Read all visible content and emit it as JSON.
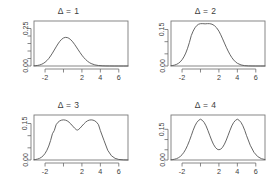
{
  "figure": {
    "layout": "2x2 panel grid",
    "background_color": "#ffffff",
    "line_color": "#555555",
    "axis_color": "#6a6a6a",
    "text_color": "#3d3d3d"
  },
  "chart_data": [
    {
      "type": "line",
      "title": "Δ = 1",
      "xlabel": "",
      "ylabel": "",
      "xlim": [
        -3.2,
        7.0
      ],
      "ylim": [
        0,
        0.3
      ],
      "grid": false,
      "legend": "none",
      "x_ticks": [
        -2,
        0,
        2,
        4,
        6
      ],
      "x_tick_labels": [
        "-2",
        "",
        "2",
        "4",
        "6"
      ],
      "y_ticks": [
        0.0,
        0.05,
        0.1,
        0.15,
        0.2,
        0.25
      ],
      "y_tick_labels": [
        "0.00",
        "",
        "",
        "",
        "",
        "0.25"
      ],
      "delta": 1,
      "description": "Unimodal mixture density, single peak near x = 0.5",
      "x": [
        -3.2,
        -3.0,
        -2.8,
        -2.6,
        -2.4,
        -2.2,
        -2.0,
        -1.8,
        -1.6,
        -1.4,
        -1.2,
        -1.0,
        -0.8,
        -0.6,
        -0.4,
        -0.2,
        0.0,
        0.2,
        0.4,
        0.5,
        0.6,
        0.8,
        1.0,
        1.2,
        1.4,
        1.6,
        1.8,
        2.0,
        2.2,
        2.4,
        2.6,
        2.8,
        3.0,
        3.4,
        3.8,
        4.2,
        4.6,
        5.0,
        5.5,
        6.0,
        6.5,
        7.0
      ],
      "values": [
        0.0012,
        0.0022,
        0.0039,
        0.0066,
        0.0107,
        0.0167,
        0.025,
        0.036,
        0.05,
        0.0668,
        0.0859,
        0.1065,
        0.1273,
        0.1471,
        0.1644,
        0.1779,
        0.1868,
        0.1907,
        0.1896,
        0.1874,
        0.184,
        0.1744,
        0.1609,
        0.1445,
        0.1263,
        0.1076,
        0.0892,
        0.072,
        0.0566,
        0.0433,
        0.0322,
        0.0233,
        0.0164,
        0.0075,
        0.0032,
        0.0012,
        0.0004,
        0.0001,
        0.0,
        0.0,
        0.0,
        0.0
      ]
    },
    {
      "type": "line",
      "title": "Δ = 2",
      "xlabel": "",
      "ylabel": "",
      "xlim": [
        -3.2,
        7.0
      ],
      "ylim": [
        0,
        0.185
      ],
      "grid": false,
      "legend": "none",
      "x_ticks": [
        -2,
        0,
        2,
        4,
        6
      ],
      "x_tick_labels": [
        "-2",
        "",
        "2",
        "4",
        "6"
      ],
      "y_ticks": [
        0.0,
        0.05,
        0.1,
        0.15
      ],
      "y_tick_labels": [
        "0.00",
        "",
        "",
        "0.15"
      ],
      "delta": 2,
      "description": "Broad flat-topped mixture density at the unimodal/bimodal threshold",
      "x": [
        -3.2,
        -3.0,
        -2.8,
        -2.6,
        -2.4,
        -2.2,
        -2.0,
        -1.8,
        -1.6,
        -1.4,
        -1.2,
        -1.0,
        -0.8,
        -0.6,
        -0.4,
        -0.2,
        0.0,
        0.25,
        0.5,
        0.75,
        1.0,
        1.25,
        1.5,
        1.75,
        2.0,
        2.2,
        2.4,
        2.6,
        2.8,
        3.0,
        3.2,
        3.4,
        3.6,
        3.8,
        4.0,
        4.4,
        4.8,
        5.2,
        5.6,
        6.0,
        6.5,
        7.0
      ],
      "values": [
        0.0012,
        0.0022,
        0.0039,
        0.0066,
        0.0108,
        0.017,
        0.0256,
        0.0375,
        0.0531,
        0.073,
        0.0972,
        0.125,
        0.1432,
        0.157,
        0.1664,
        0.1719,
        0.174,
        0.1742,
        0.1733,
        0.1742,
        0.174,
        0.1719,
        0.1664,
        0.157,
        0.1432,
        0.1283,
        0.1115,
        0.0942,
        0.0772,
        0.0613,
        0.047,
        0.0348,
        0.0248,
        0.017,
        0.0112,
        0.0043,
        0.0014,
        0.0004,
        0.0001,
        0.0,
        0.0,
        0.0
      ]
    },
    {
      "type": "line",
      "title": "Δ = 3",
      "xlabel": "",
      "ylabel": "",
      "xlim": [
        -3.2,
        7.0
      ],
      "ylim": [
        0,
        0.185
      ],
      "grid": false,
      "legend": "none",
      "x_ticks": [
        -2,
        0,
        2,
        4,
        6
      ],
      "x_tick_labels": [
        "-2",
        "",
        "2",
        "4",
        "6"
      ],
      "y_ticks": [
        0.0,
        0.05,
        0.1,
        0.15
      ],
      "y_tick_labels": [
        "0.00",
        "",
        "",
        "0.15"
      ],
      "delta": 3,
      "description": "Bimodal mixture density with shallow central dip, peaks near x = 0 and x = 3",
      "x": [
        -3.2,
        -3.0,
        -2.8,
        -2.6,
        -2.4,
        -2.2,
        -2.0,
        -1.8,
        -1.6,
        -1.4,
        -1.2,
        -1.0,
        -0.8,
        -0.6,
        -0.4,
        -0.2,
        0.0,
        0.2,
        0.4,
        0.6,
        0.8,
        1.0,
        1.2,
        1.4,
        1.5,
        1.6,
        1.8,
        2.0,
        2.2,
        2.4,
        2.6,
        2.8,
        3.0,
        3.2,
        3.4,
        3.6,
        3.8,
        4.0,
        4.4,
        4.8,
        5.2,
        5.6,
        6.0,
        6.5,
        7.0
      ],
      "values": [
        0.0012,
        0.0022,
        0.004,
        0.0067,
        0.0111,
        0.0176,
        0.027,
        0.04,
        0.0574,
        0.08,
        0.108,
        0.121,
        0.145,
        0.155,
        0.161,
        0.164,
        0.165,
        0.164,
        0.161,
        0.1555,
        0.148,
        0.1395,
        0.131,
        0.1245,
        0.123,
        0.1245,
        0.131,
        0.1395,
        0.148,
        0.1555,
        0.161,
        0.164,
        0.165,
        0.164,
        0.161,
        0.155,
        0.145,
        0.121,
        0.08,
        0.04,
        0.0176,
        0.0067,
        0.0022,
        0.0006,
        0.0001
      ]
    },
    {
      "type": "line",
      "title": "Δ = 4",
      "xlabel": "",
      "ylabel": "",
      "xlim": [
        -3.2,
        7.0
      ],
      "ylim": [
        0,
        0.22
      ],
      "grid": false,
      "legend": "none",
      "x_ticks": [
        -2,
        0,
        2,
        4,
        6
      ],
      "x_tick_labels": [
        "-2",
        "",
        "2",
        "4",
        "6"
      ],
      "y_ticks": [
        0.0,
        0.05,
        0.1,
        0.15
      ],
      "y_tick_labels": [
        "0.00",
        "",
        "",
        "0.15"
      ],
      "delta": 4,
      "description": "Strongly bimodal mixture density with deep valley, peaks near x = 0 and x = 4",
      "x": [
        -3.2,
        -3.0,
        -2.8,
        -2.6,
        -2.4,
        -2.2,
        -2.0,
        -1.8,
        -1.6,
        -1.4,
        -1.2,
        -1.0,
        -0.8,
        -0.6,
        -0.4,
        -0.2,
        0.0,
        0.2,
        0.4,
        0.6,
        0.8,
        1.0,
        1.2,
        1.4,
        1.6,
        1.8,
        2.0,
        2.2,
        2.4,
        2.6,
        2.8,
        3.0,
        3.2,
        3.4,
        3.6,
        3.8,
        4.0,
        4.2,
        4.4,
        4.6,
        4.8,
        5.0,
        5.4,
        5.8,
        6.2,
        6.6,
        7.0
      ],
      "values": [
        0.0011,
        0.0022,
        0.0039,
        0.0066,
        0.0108,
        0.017,
        0.0257,
        0.0376,
        0.053,
        0.072,
        0.0942,
        0.119,
        0.145,
        0.167,
        0.1835,
        0.194,
        0.1995,
        0.194,
        0.1835,
        0.167,
        0.145,
        0.121,
        0.0975,
        0.0775,
        0.0625,
        0.053,
        0.05,
        0.053,
        0.0625,
        0.0775,
        0.0975,
        0.121,
        0.145,
        0.167,
        0.1835,
        0.194,
        0.1995,
        0.194,
        0.1835,
        0.167,
        0.145,
        0.119,
        0.072,
        0.0376,
        0.017,
        0.0066,
        0.0022
      ]
    }
  ]
}
